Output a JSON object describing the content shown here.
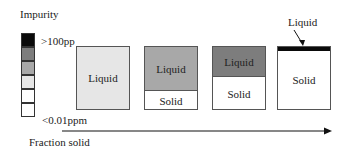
{
  "legend": {
    "title": "Impurity",
    "high_label": ">100pp",
    "low_label": "<0.01ppm",
    "cells": [
      "#0a0a0a",
      "#7d7d7d",
      "#a8a8a8",
      "#e6e6e6",
      "#ffffff",
      "#ffffff"
    ]
  },
  "stages": [
    {
      "liquid_label": "Liquid",
      "solid_label": "",
      "liquid_color": "#e6e6e6",
      "liquid_height": 64
    },
    {
      "liquid_label": "Liquid",
      "solid_label": "Solid",
      "liquid_color": "#a8a8a8",
      "liquid_height": 43
    },
    {
      "liquid_label": "Liquid",
      "solid_label": "Solid",
      "liquid_color": "#7d7d7d",
      "liquid_height": 29
    },
    {
      "liquid_label": "",
      "solid_label": "Solid",
      "liquid_color": "#0a0a0a",
      "liquid_height": 4
    }
  ],
  "callout": {
    "label": "Liquid"
  },
  "axis": {
    "label": "Fraction solid"
  }
}
